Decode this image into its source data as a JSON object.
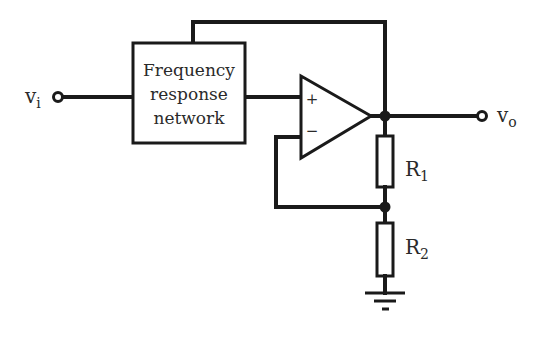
{
  "diagram": {
    "type": "circuit-schematic",
    "block": {
      "lines": [
        "Frequency",
        "response",
        "network"
      ]
    },
    "opamp": {
      "plus_label": "+",
      "minus_label": "−"
    },
    "input": {
      "label": "v",
      "sub": "i"
    },
    "output": {
      "label": "v",
      "sub": "o"
    },
    "resistors": [
      {
        "label": "R",
        "sub": "1"
      },
      {
        "label": "R",
        "sub": "2"
      }
    ],
    "colors": {
      "stroke": "#1a1a1a",
      "background": "#ffffff"
    }
  }
}
